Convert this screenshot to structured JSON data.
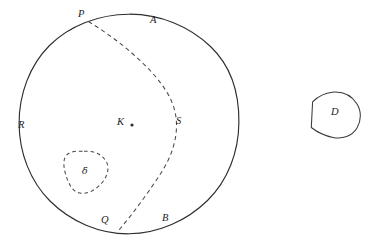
{
  "figure": {
    "background_color": "#ffffff",
    "ink_color": "#2e2e2e",
    "width": 376,
    "height": 244
  },
  "labels": {
    "p": "P",
    "a": "A",
    "r": "R",
    "k": "K",
    "s": "S",
    "delta": "δ",
    "q": "Q",
    "b": "B",
    "d": "D"
  },
  "shapes": {
    "main_circle": {
      "name": "main-circle",
      "style": "solid",
      "center_x": 129,
      "center_y": 124,
      "radius": 110
    },
    "chord_arc": {
      "name": "dashed-chord-arc",
      "style": "dashed",
      "from_label": "P",
      "to_label": "Q",
      "from_x": 88,
      "from_y": 21,
      "to_x": 118,
      "to_y": 230,
      "bulge_x": 176,
      "bulge_y": 124
    },
    "delta_blob": {
      "name": "delta-blob",
      "style": "dashed",
      "center_x": 86,
      "center_y": 172,
      "width": 46,
      "height": 43
    },
    "d_region": {
      "name": "d-region",
      "style": "solid",
      "center_x": 336,
      "center_y": 114,
      "width": 48,
      "height": 46
    },
    "k_point": {
      "name": "k-center-point",
      "x": 132,
      "y": 125,
      "radius": 1.6
    }
  },
  "label_positions": {
    "p": {
      "x": 78,
      "y": 9
    },
    "a": {
      "x": 150,
      "y": 15
    },
    "r": {
      "x": 18,
      "y": 120
    },
    "k": {
      "x": 117,
      "y": 117
    },
    "s": {
      "x": 176,
      "y": 116
    },
    "delta": {
      "x": 82,
      "y": 166
    },
    "q": {
      "x": 101,
      "y": 215
    },
    "b": {
      "x": 162,
      "y": 213
    },
    "d": {
      "x": 331,
      "y": 107
    }
  }
}
